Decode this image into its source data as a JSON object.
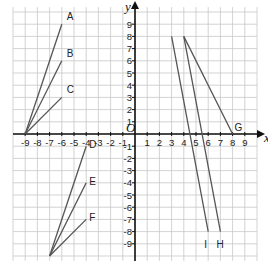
{
  "diagram": {
    "type": "coordinate-grid",
    "axes": {
      "x_label": "x",
      "y_label": "y",
      "origin_label": "O",
      "range": [
        -10,
        10
      ]
    },
    "x_tick_labels": [
      "-9",
      "-8",
      "-7",
      "-6",
      "-5",
      "-4",
      "-3",
      "-2",
      "-1",
      "1",
      "2",
      "3",
      "4",
      "5",
      "6",
      "7",
      "8",
      "9"
    ],
    "y_tick_labels": [
      "9",
      "8",
      "7",
      "6",
      "5",
      "4",
      "3",
      "2",
      "1",
      "-1",
      "-2",
      "-3",
      "-4",
      "-5",
      "-6",
      "-7",
      "-8",
      "-9"
    ],
    "colors": {
      "grid": "#c8c8c8",
      "axis": "#111111",
      "line": "#555555"
    },
    "segments": [
      {
        "label": "A",
        "from": [
          -9,
          0
        ],
        "to": [
          -6,
          9
        ]
      },
      {
        "label": "B",
        "from": [
          -9,
          0
        ],
        "to": [
          -6,
          6
        ]
      },
      {
        "label": "C",
        "from": [
          -9,
          0
        ],
        "to": [
          -6,
          3
        ]
      },
      {
        "label": "D",
        "from": [
          -7,
          -10
        ],
        "to": [
          -4,
          -1
        ]
      },
      {
        "label": "E",
        "from": [
          -7,
          -10
        ],
        "to": [
          -4,
          -4
        ]
      },
      {
        "label": "F",
        "from": [
          -7,
          -10
        ],
        "to": [
          -4,
          -7
        ]
      },
      {
        "label": "G",
        "from": [
          4,
          8
        ],
        "to": [
          8,
          0
        ]
      },
      {
        "label": "H",
        "from": [
          4,
          8
        ],
        "to": [
          7,
          -8
        ]
      },
      {
        "label": "I",
        "from": [
          3,
          8
        ],
        "to": [
          6,
          -8
        ]
      }
    ]
  }
}
